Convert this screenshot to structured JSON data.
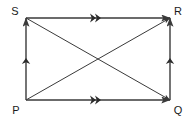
{
  "diagram": {
    "shape": "rectangle",
    "stroke_color": "#3a3a3a",
    "label_color": "#1a1a1a",
    "background_color": "#ffffff",
    "vertices": [
      {
        "name": "S",
        "label": "S",
        "x": 26,
        "y": 18,
        "label_x": 15,
        "label_y": 15
      },
      {
        "name": "R",
        "label": "R",
        "x": 170,
        "y": 18,
        "label_x": 172,
        "label_y": 15
      },
      {
        "name": "Q",
        "label": "Q",
        "x": 170,
        "y": 100,
        "label_x": 172,
        "label_y": 115
      },
      {
        "name": "P",
        "label": "P",
        "x": 26,
        "y": 100,
        "label_x": 14,
        "label_y": 115
      }
    ],
    "edges": [
      {
        "name": "edge-SR",
        "from": "S",
        "to": "R",
        "marker": "double-chevron",
        "arrowhead": "end"
      },
      {
        "name": "edge-PQ",
        "from": "P",
        "to": "Q",
        "marker": "double-chevron",
        "arrowhead": "end"
      },
      {
        "name": "edge-PS",
        "from": "P",
        "to": "S",
        "marker": "single-chevron",
        "arrowhead": "end"
      },
      {
        "name": "edge-QR",
        "from": "Q",
        "to": "R",
        "marker": "single-chevron",
        "arrowhead": "end"
      }
    ],
    "diagonals": [
      {
        "name": "diagonal-SQ",
        "from": "S",
        "to": "Q",
        "arrowhead": "end"
      },
      {
        "name": "diagonal-PR",
        "from": "P",
        "to": "R",
        "arrowhead": "end"
      }
    ]
  }
}
